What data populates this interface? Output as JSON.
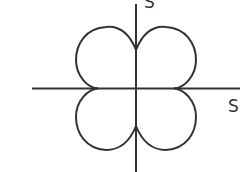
{
  "diagram": {
    "type": "four-lobed polar curve on axes",
    "axes": {
      "horizontal_label": "S",
      "vertical_label": "S"
    },
    "colors": {
      "stroke": "#333333",
      "background": "#ffffff"
    },
    "lobes": [
      "upper-left",
      "upper-right",
      "lower-left",
      "lower-right"
    ]
  }
}
